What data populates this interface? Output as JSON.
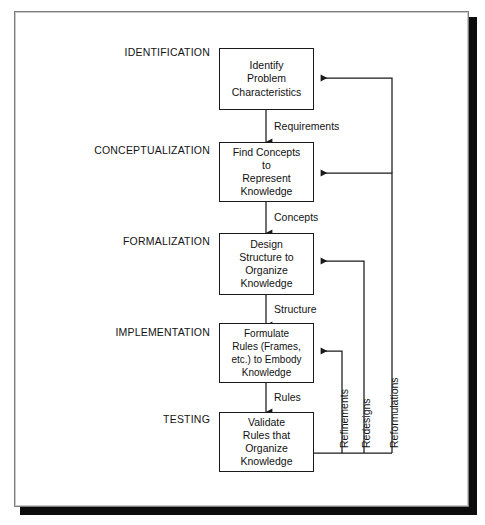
{
  "diagram": {
    "type": "flowchart",
    "colors": {
      "line": "#1a1a1a",
      "box_border": "#1a1a1a",
      "box_fill": "#ffffff",
      "text": "#111111",
      "frame_border": "#7d7d7d",
      "frame_shadow": "#0c0c0c",
      "page_background": "#ffffff"
    },
    "stages": [
      {
        "id": "identification",
        "label": "IDENTIFICATION",
        "box_lines": [
          "Identify",
          "Problem",
          "Characteristics"
        ]
      },
      {
        "id": "conceptualization",
        "label": "CONCEPTUALIZATION",
        "box_lines": [
          "Find Concepts",
          "to",
          "Represent",
          "Knowledge"
        ]
      },
      {
        "id": "formalization",
        "label": "FORMALIZATION",
        "box_lines": [
          "Design",
          "Structure to",
          "Organize",
          "Knowledge"
        ]
      },
      {
        "id": "implementation",
        "label": "IMPLEMENTATION",
        "box_lines": [
          "Formulate",
          "Rules (Frames,",
          "etc.) to Embody",
          "Knowledge"
        ]
      },
      {
        "id": "testing",
        "label": "TESTING",
        "box_lines": [
          "Validate",
          "Rules that",
          "Organize",
          "Knowledge"
        ]
      }
    ],
    "flow_labels": [
      {
        "id": "requirements",
        "text": "Requirements",
        "from": "identification",
        "to": "conceptualization"
      },
      {
        "id": "concepts",
        "text": "Concepts",
        "from": "conceptualization",
        "to": "formalization"
      },
      {
        "id": "structure",
        "text": "Structure",
        "from": "formalization",
        "to": "implementation"
      },
      {
        "id": "rules",
        "text": "Rules",
        "from": "implementation",
        "to": "testing"
      }
    ],
    "feedback_labels": [
      {
        "id": "refinements",
        "text": "Refinements",
        "from": "testing",
        "to": "implementation"
      },
      {
        "id": "redesigns",
        "text": "Redesigns",
        "from": "testing",
        "to": "formalization"
      },
      {
        "id": "reformulations",
        "text": "Reformulations",
        "from": "testing",
        "to": "conceptualization and identification"
      }
    ]
  }
}
